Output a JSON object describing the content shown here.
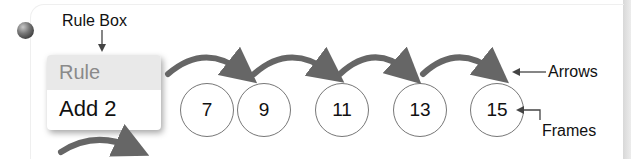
{
  "callouts": {
    "rule_box": "Rule Box",
    "arrows": "Arrows",
    "frames": "Frames"
  },
  "rule_box": {
    "title": "Rule",
    "rule": "Add 2"
  },
  "frames": [
    {
      "value": "7"
    },
    {
      "value": "9"
    },
    {
      "value": "11"
    },
    {
      "value": "13"
    },
    {
      "value": "15"
    }
  ],
  "colors": {
    "arrow": "#666666",
    "rule_header_bg": "#e9e9e9",
    "rule_header_text": "#8a8a8a",
    "frame_border": "#777777"
  }
}
